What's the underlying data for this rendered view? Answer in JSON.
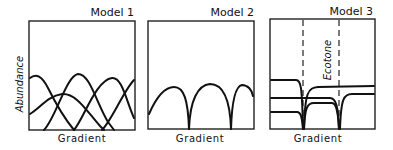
{
  "panels": [
    {
      "title": "Model 1",
      "xlabel": "Gradient",
      "ylabel": "Abundance",
      "description": "Overlapping bell-shaped species distributions along gradient"
    },
    {
      "title": "Model 2",
      "xlabel": "Gradient",
      "description": "Adjacent non-overlapping arched distributions with sharp boundaries"
    },
    {
      "title": "Model 3",
      "xlabel": "Gradient",
      "annotation": "Ecotone",
      "description": "Plateau distributions with abrupt shifts at ecotone boundaries (dashed lines)"
    }
  ]
}
